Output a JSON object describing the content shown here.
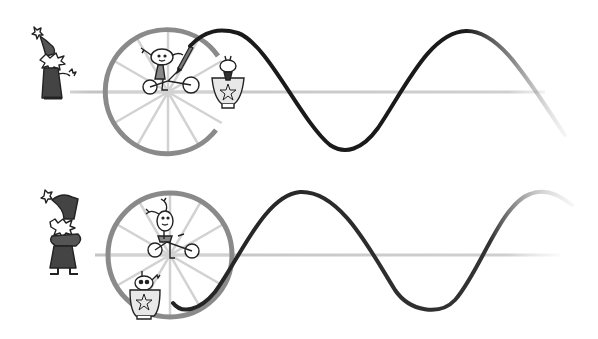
{
  "figure": {
    "description": "Hand-drawn illustration: two panels showing a rolling wheel tracing a sine wave, with cartoon characters (wizard, child on tricycle, creature in pot).",
    "colors": {
      "background": "#ffffff",
      "curve": "#1a1a1a",
      "wheel_rim": "#8a8a8a",
      "spokes": "#cfcfcf",
      "axis": "#bdbdbd",
      "ink": "#222222",
      "fill_dark": "#555555"
    },
    "panels": [
      {
        "id": "top",
        "axis_y": 92,
        "wheel": {
          "cx": 168,
          "cy": 92,
          "r": 62,
          "spokes": 12
        },
        "characters": [
          "wizard",
          "child-on-tricycle",
          "creature-in-pot"
        ],
        "curve_phase": "cosine-start-high"
      },
      {
        "id": "bottom",
        "axis_y": 255,
        "wheel": {
          "cx": 170,
          "cy": 255,
          "r": 62,
          "spokes": 12
        },
        "characters": [
          "wizard",
          "child-on-tricycle",
          "creature-in-pot"
        ],
        "curve_phase": "sine-start-low"
      }
    ]
  }
}
